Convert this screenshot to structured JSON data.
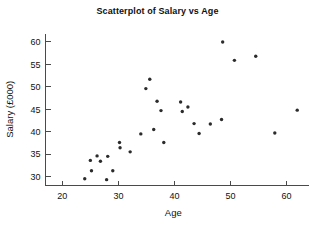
{
  "chart_data": {
    "type": "scatter",
    "title": "Scatterplot of Salary vs Age",
    "xlabel": "Age",
    "ylabel": "Salary (£000)",
    "xlim": [
      17,
      64
    ],
    "ylim": [
      28,
      62
    ],
    "xticks": [
      20,
      30,
      40,
      50,
      60
    ],
    "yticks": [
      30,
      35,
      40,
      45,
      50,
      55,
      60
    ],
    "xtick_labels": [
      "20",
      "30",
      "40",
      "50",
      "60"
    ],
    "ytick_labels": [
      "30",
      "35",
      "40",
      "45",
      "50",
      "55",
      "60"
    ],
    "grid": false,
    "legend": null,
    "marker": "circle",
    "marker_color": "#2b2b2b",
    "series": [
      {
        "name": "Salary vs Age",
        "points": [
          [
            24.0,
            29.5
          ],
          [
            25.0,
            33.6
          ],
          [
            25.2,
            31.3
          ],
          [
            26.2,
            34.6
          ],
          [
            26.8,
            33.4
          ],
          [
            27.9,
            29.3
          ],
          [
            28.1,
            34.5
          ],
          [
            29.0,
            31.3
          ],
          [
            30.2,
            37.6
          ],
          [
            30.3,
            36.4
          ],
          [
            32.1,
            35.5
          ],
          [
            34.0,
            39.5
          ],
          [
            34.9,
            49.6
          ],
          [
            35.6,
            51.7
          ],
          [
            36.3,
            40.5
          ],
          [
            36.9,
            46.8
          ],
          [
            37.6,
            44.7
          ],
          [
            38.1,
            37.6
          ],
          [
            41.1,
            46.6
          ],
          [
            41.4,
            44.5
          ],
          [
            42.4,
            45.5
          ],
          [
            43.5,
            41.8
          ],
          [
            44.4,
            39.6
          ],
          [
            46.4,
            41.7
          ],
          [
            48.4,
            42.7
          ],
          [
            48.6,
            60.0
          ],
          [
            50.7,
            55.9
          ],
          [
            54.5,
            56.8
          ],
          [
            57.9,
            39.7
          ],
          [
            61.9,
            44.8
          ]
        ]
      }
    ]
  }
}
